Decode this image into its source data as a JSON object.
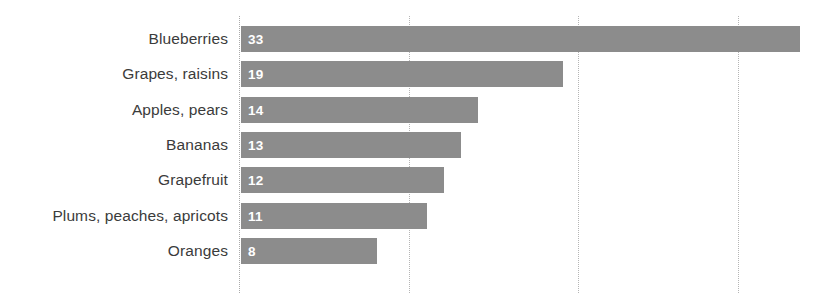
{
  "chart_data": {
    "type": "bar",
    "orientation": "horizontal",
    "title": "",
    "subtitle": "",
    "xlabel": "",
    "ylabel": "",
    "categories": [
      "Blueberries",
      "Grapes, raisins",
      "Apples, pears",
      "Bananas",
      "Grapefruit",
      "Plums, peaches, apricots",
      "Oranges"
    ],
    "values": [
      33,
      19,
      14,
      13,
      12,
      11,
      8
    ],
    "value_labels": [
      "33",
      "19",
      "14",
      "13",
      "12",
      "11",
      "8"
    ],
    "xlim": [
      0,
      35
    ],
    "xticks": [
      0,
      10,
      20,
      30
    ],
    "xtick_labels": [
      "",
      "",
      "",
      ""
    ],
    "grid": true,
    "grid_style": "dotted-vertical",
    "legend": null,
    "bar_color": "#8c8c8c",
    "value_label_color": "#ffffff",
    "category_label_color": "#3b3b3b",
    "gridline_color": "#b5b5b5",
    "background_color": "#ffffff"
  }
}
